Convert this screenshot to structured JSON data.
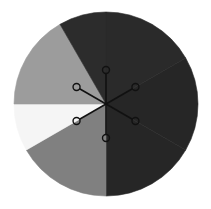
{
  "wheel": {
    "center": [
      106,
      104
    ],
    "radius": 92,
    "segments": [
      {
        "name": "top-right",
        "start_deg": -90,
        "end_deg": -30,
        "color": "#2a2a2a"
      },
      {
        "name": "right",
        "start_deg": -30,
        "end_deg": 30,
        "color": "#262626"
      },
      {
        "name": "bottom-right",
        "start_deg": 30,
        "end_deg": 90,
        "color": "#262626"
      },
      {
        "name": "bottom-left",
        "start_deg": 90,
        "end_deg": 150,
        "color": "#808080"
      },
      {
        "name": "left-lower",
        "start_deg": 150,
        "end_deg": 180,
        "color": "#f5f5f5"
      },
      {
        "name": "left-upper",
        "start_deg": 180,
        "end_deg": 240,
        "color": "#9c9c9c"
      },
      {
        "name": "top-left",
        "start_deg": 240,
        "end_deg": 270,
        "color": "#2c2c2c"
      }
    ],
    "slices": [
      {
        "name": "top-dark",
        "from": [
          62,
          26
        ],
        "to": [
          151,
          184
        ],
        "via": "right",
        "color": "#262626"
      },
      {
        "name": "bottom-gray",
        "color": "#808080"
      },
      {
        "name": "lower-left-white",
        "color": "#f4f4f4"
      },
      {
        "name": "upper-left-light-gray",
        "color": "#9a9a9a"
      }
    ],
    "center_icon": {
      "name": "hub-spokes-icon",
      "stroke": "#111111",
      "spoke_length": 34,
      "node_radius": 3.5,
      "spoke_angles_deg": [
        -90,
        -30,
        30,
        90,
        150,
        210
      ]
    }
  }
}
